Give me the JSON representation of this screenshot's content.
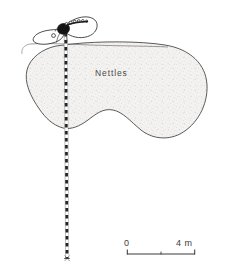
{
  "figure": {
    "type": "field-sketch-map",
    "background_color": "#ffffff",
    "ink_color": "#3a3a3a",
    "patch_fill_color": "#f0efed",
    "stipple_color": "#c9c7c4"
  },
  "map": {
    "labels": [
      {
        "name": "nettles-patch-label",
        "text": "Nettles",
        "x": 95,
        "y": 68
      }
    ],
    "features": [
      {
        "name": "nettles-patch",
        "kind": "vegetation-polygon",
        "label": "Nettles",
        "fill": "#f0efed",
        "stroke": "#3f3f3f"
      },
      {
        "name": "insect-form",
        "kind": "small-outlined-form",
        "lobes": 2,
        "has-dark-body": true,
        "has-bead-chain": true
      },
      {
        "name": "survey-transect-line",
        "kind": "dashed-vertical-line",
        "style": "black-and-white-dashed"
      },
      {
        "name": "patch-boundary-tendril",
        "kind": "thin-curve"
      }
    ]
  },
  "scale_bar": {
    "name": "scale-bar",
    "start_label": "0",
    "end_label": "4 m",
    "unit": "m",
    "start_value": 0,
    "end_value": 4,
    "midpoint_value": 2,
    "ticks": [
      0,
      2,
      4
    ],
    "bar_left_px": 127,
    "bar_right_px": 195,
    "bar_y_px": 254
  }
}
